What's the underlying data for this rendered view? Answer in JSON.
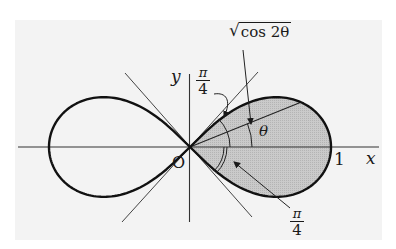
{
  "figure": {
    "curve": "r^2 = cos 2θ",
    "origin_px": [
      190,
      147
    ],
    "scale_px": 141,
    "colors": {
      "paper": "#f3f3f3",
      "ink": "#1a1a1a",
      "shade": "#c4c4c4",
      "thin_line": "#444444"
    },
    "shaded_region": "right lobe (−π/4 ≤ θ ≤ π/4)",
    "theta_ray_deg": 22
  },
  "labels": {
    "x_axis": "x",
    "y_axis": "y",
    "origin": "O",
    "x_intercept": "1",
    "theta": "θ",
    "radius_expr": "cos 2θ",
    "radical": "√",
    "upper_angle": {
      "num": "π",
      "den": "4"
    },
    "lower_angle": {
      "num": "π",
      "den": "4"
    }
  }
}
